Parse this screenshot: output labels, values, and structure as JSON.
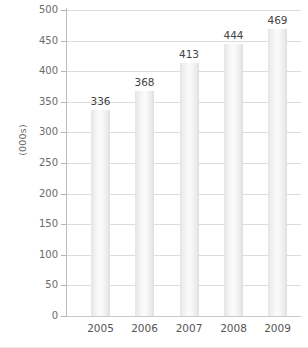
{
  "chart_data": {
    "type": "bar",
    "title": "",
    "xlabel": "",
    "ylabel": "(000s)",
    "categories": [
      "2005",
      "2006",
      "2007",
      "2008",
      "2009"
    ],
    "values": [
      336,
      368,
      413,
      444,
      469
    ],
    "value_labels": [
      "336",
      "368",
      "413",
      "444",
      "469"
    ],
    "ylim": [
      0,
      500
    ],
    "ytick_step": 50,
    "yticks": [
      0,
      50,
      100,
      150,
      200,
      250,
      300,
      350,
      400,
      450,
      500
    ],
    "ytick_labels": [
      "0",
      "50",
      "100",
      "150",
      "200",
      "250",
      "300",
      "350",
      "400",
      "450",
      "500"
    ],
    "grid": true,
    "legend": false,
    "legend_position": "none",
    "series": [
      {
        "name": "",
        "values": [
          336,
          368,
          413,
          444,
          469
        ]
      }
    ],
    "colors": {
      "bar_fill_light": "#fbfbfb",
      "bar_fill_edge": "#dedede",
      "gridline": "#dcdcdc",
      "axis": "#bcbcbc",
      "tick_label": "#6b6b6b",
      "value_label": "#444444",
      "background": "#ffffff"
    }
  }
}
